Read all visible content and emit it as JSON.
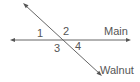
{
  "diagram": {
    "type": "intersecting-lines",
    "lines": [
      {
        "name": "Main",
        "label": "Main",
        "orientation": "horizontal",
        "from": [
          11,
          40
        ],
        "to": [
          130,
          40
        ],
        "arrows": "both"
      },
      {
        "name": "Walnut",
        "label": "Walnut",
        "orientation": "diagonal",
        "from": [
          24,
          4
        ],
        "to": [
          101,
          75
        ],
        "arrows": "both"
      }
    ],
    "angles": [
      {
        "label": "1",
        "position": "upper-left"
      },
      {
        "label": "2",
        "position": "upper-right"
      },
      {
        "label": "3",
        "position": "lower-left"
      },
      {
        "label": "4",
        "position": "lower-right"
      }
    ],
    "colors": {
      "line": "#666666",
      "text": "#555555",
      "background": "#ffffff"
    }
  }
}
